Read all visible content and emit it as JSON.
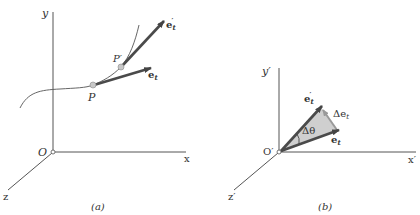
{
  "panels": [
    {
      "id": "a",
      "caption": "(a)",
      "axes": {
        "x": "x",
        "y": "y",
        "z": "z",
        "origin": "O"
      },
      "points": {
        "P": "P",
        "P_prime": "P′"
      },
      "vectors": {
        "e_t": "e",
        "e_t_sub": "t",
        "e_t_prime": "e",
        "e_t_prime_sub": "t",
        "e_t_prime_sup": "′"
      }
    },
    {
      "id": "b",
      "caption": "(b)",
      "axes": {
        "x": "x′",
        "y": "y′",
        "z": "z′",
        "origin": "O′"
      },
      "vectors": {
        "e_t": "e",
        "e_t_sub": "t",
        "e_t_prime": "e",
        "e_t_prime_sub": "t",
        "e_t_prime_sup": "′",
        "delta_e": "Δe",
        "delta_e_sub": "t"
      },
      "angle": "Δθ"
    }
  ],
  "colors": {
    "axis": "#555555",
    "vector": "#4a4a4a",
    "curve": "#555555",
    "triangle_fill": "#cfcfcf",
    "delta_vector": "#999999",
    "point_fill": "#c8c8c8"
  }
}
